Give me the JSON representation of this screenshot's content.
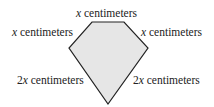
{
  "diagram": {
    "shape": "pentagon",
    "fill": "#e6e6e6",
    "stroke": "#222222",
    "vertices": [
      [
        92,
        22
      ],
      [
        124,
        22
      ],
      [
        148,
        48
      ],
      [
        108,
        104
      ],
      [
        69,
        48
      ]
    ],
    "labels": {
      "top": {
        "var": "x",
        "unit": " centimeters"
      },
      "upper_left": {
        "var": "x",
        "unit": " centimeters"
      },
      "upper_right": {
        "var": "x",
        "unit": " centimeters"
      },
      "lower_left": {
        "coef": "2",
        "var": "x",
        "unit": " centimeters"
      },
      "lower_right": {
        "coef": "2",
        "var": "x",
        "unit": " centimeters"
      }
    }
  }
}
